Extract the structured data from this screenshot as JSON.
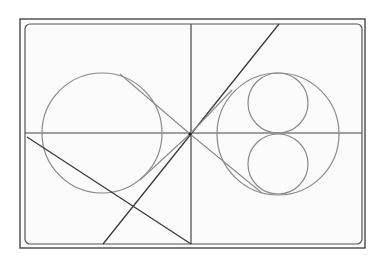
{
  "diagram": {
    "background": "#ffffff",
    "paper_color": "#fbfbfb",
    "stroke_dark": "#3a3a3a",
    "stroke_light": "#8a8a8a",
    "outer_frame": {
      "x": 20,
      "y": 19,
      "w": 345,
      "h": 229
    },
    "inner_frame": {
      "x": 25,
      "y": 24,
      "w": 337,
      "h": 220,
      "rx": 5
    },
    "horizontal_divider_y": 133,
    "vertical_divider_x": 191,
    "center_point": {
      "x": 190,
      "y": 134
    },
    "left_circle": {
      "cx": 102,
      "cy": 133,
      "r": 60
    },
    "right_circle": {
      "cx": 278,
      "cy": 134,
      "r": 61
    },
    "small_circles": [
      {
        "cx": 278,
        "cy": 103,
        "r": 30
      },
      {
        "cx": 278,
        "cy": 164,
        "r": 30
      }
    ],
    "lines": [
      {
        "name": "main-diagonal",
        "x1": 279,
        "y1": 24,
        "x2": 103,
        "y2": 244,
        "tone": "dark"
      },
      {
        "name": "left-diagonal",
        "x1": 27,
        "y1": 137,
        "x2": 191,
        "y2": 244,
        "tone": "dark"
      },
      {
        "name": "tangent-left-top",
        "x1": 120,
        "y1": 74,
        "x2": 190,
        "y2": 134,
        "tone": "light"
      },
      {
        "name": "tangent-right-bottom",
        "x1": 190,
        "y1": 134,
        "x2": 262,
        "y2": 193,
        "tone": "light"
      },
      {
        "name": "tangent-right-upper",
        "x1": 190,
        "y1": 134,
        "x2": 232,
        "y2": 90,
        "tone": "light"
      },
      {
        "name": "tangent-left-lower",
        "x1": 190,
        "y1": 134,
        "x2": 140,
        "y2": 180,
        "tone": "light"
      }
    ]
  }
}
